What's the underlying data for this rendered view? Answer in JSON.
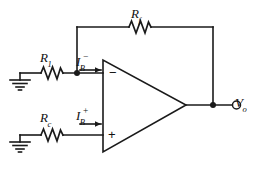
{
  "figure": {
    "type": "circuit-schematic",
    "background_color": "#ffffff",
    "line_color": "#1a1a1a"
  },
  "components": {
    "feedback_resistor": {
      "label_main": "R",
      "label_sub": "f",
      "name": "Rf"
    },
    "input_resistor": {
      "label_main": "R",
      "label_sub": "1",
      "name": "R1"
    },
    "compensation_resistor": {
      "label_main": "R",
      "label_sub": "c",
      "name": "Rc"
    },
    "opamp": {
      "inverting_terminal": "−",
      "noninverting_terminal": "+"
    }
  },
  "currents": {
    "inverting_bias": {
      "label_main": "I",
      "label_sub": "B",
      "label_sup": "−",
      "name": "IB-"
    },
    "noninverting_bias": {
      "label_main": "I",
      "label_sub": "B",
      "label_sup": "+",
      "name": "IB+"
    }
  },
  "output": {
    "label_main": "V",
    "label_sub": "o",
    "name": "Vo"
  }
}
